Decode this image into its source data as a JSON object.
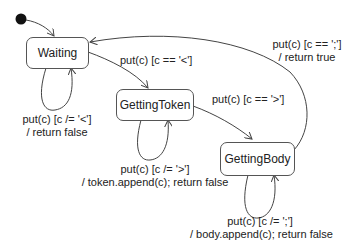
{
  "diagram": {
    "type": "state-machine",
    "initial_state": "Waiting",
    "states": [
      {
        "id": "waiting",
        "label": "Waiting"
      },
      {
        "id": "getting_token",
        "label": "GettingToken"
      },
      {
        "id": "getting_body",
        "label": "GettingBody"
      }
    ],
    "transitions": [
      {
        "from": "Waiting",
        "to": "Waiting",
        "line1": "put(c) [c /= '<']",
        "line2": "/ return false"
      },
      {
        "from": "Waiting",
        "to": "GettingToken",
        "line1": "put(c) [c == '<']"
      },
      {
        "from": "GettingToken",
        "to": "GettingToken",
        "line1": "put(c) [c /= '>']",
        "line2": "/ token.append(c); return false"
      },
      {
        "from": "GettingToken",
        "to": "GettingBody",
        "line1": "put(c) [c == '>']"
      },
      {
        "from": "GettingBody",
        "to": "GettingBody",
        "line1": "put(c) [c /= ';']",
        "line2": "/ body.append(c); return false"
      },
      {
        "from": "GettingBody",
        "to": "Waiting",
        "line1": "put(c) [c == ';']",
        "line2": "/ return true"
      }
    ]
  }
}
